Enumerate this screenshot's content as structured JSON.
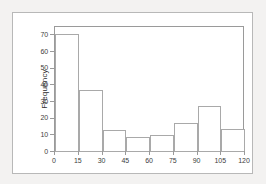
{
  "chart_data": {
    "type": "bar",
    "title": "",
    "subtitle": "",
    "xlabel": "",
    "ylabel": "Frequency",
    "grid": false,
    "legend": false,
    "bin_width": 15,
    "bin_edges": [
      0,
      15,
      30,
      45,
      60,
      75,
      90,
      105,
      120
    ],
    "categories": [
      "0-15",
      "15-30",
      "30-45",
      "45-60",
      "60-75",
      "75-90",
      "90-105",
      "105-120"
    ],
    "values": [
      71,
      37,
      13,
      9,
      10,
      17.5,
      27.5,
      14
    ],
    "xlim": [
      0,
      120
    ],
    "ylim": [
      0,
      75
    ],
    "xticks": [
      0,
      15,
      30,
      45,
      60,
      75,
      90,
      105,
      120
    ],
    "yticks": [
      0,
      10,
      20,
      30,
      40,
      50,
      60,
      70
    ],
    "xtick_labels": [
      "0",
      "15",
      "30",
      "45",
      "60",
      "75",
      "90",
      "105",
      "120"
    ],
    "ytick_labels": [
      "0",
      "10",
      "20",
      "30",
      "40",
      "50",
      "60",
      "70"
    ],
    "bar_fill_color": "#ffffff",
    "bar_border_color": "#a9a9a9",
    "axis_color": "#9a9a9a",
    "tick_label_color": "#3d3d3d",
    "plot_background": "#ffffff",
    "page_background": "#f3f2f1"
  }
}
